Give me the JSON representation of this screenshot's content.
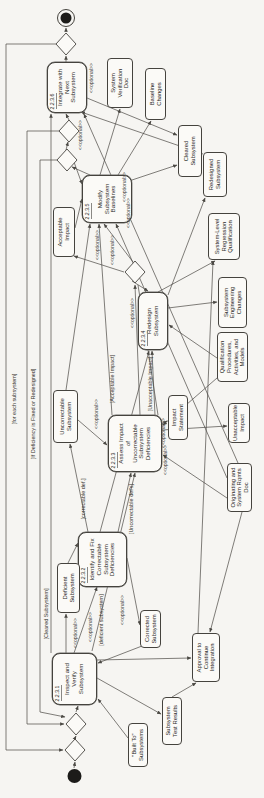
{
  "diagram": {
    "colors": {
      "background": "#f6f5f2",
      "node_fill": "#fbfaf7",
      "stroke": "#45433e",
      "line": "#4a4843",
      "text": "#2b2a27"
    },
    "optional_label": "<<optional>>",
    "activities": [
      {
        "id": "a1",
        "num": "2.2.3.1",
        "label": "Inspect and\nVerify\nSubsystem",
        "x": 93,
        "y": 52,
        "w": 52,
        "h": 45
      },
      {
        "id": "a2",
        "num": "2.2.3.2",
        "label": "Identify and Fix\nCorrectable\nSubsystem\nDeficiencies",
        "x": 211,
        "y": 78,
        "w": 55,
        "h": 49
      },
      {
        "id": "a3",
        "num": "2.2.3.3",
        "label": "Assess Impact\nof\nUncorrectable\nSubsystem\nDeficiencies",
        "x": 326,
        "y": 108,
        "w": 57,
        "h": 54
      },
      {
        "id": "a4",
        "num": "2.2.3.4",
        "label": "Redesign\nSubsystem",
        "x": 448,
        "y": 138,
        "w": 58,
        "h": 30
      },
      {
        "id": "a5",
        "num": "2.2.3.5",
        "label": "Modify\nSubsystem\nBaselines",
        "x": 575,
        "y": 82,
        "w": 48,
        "h": 50
      },
      {
        "id": "a6",
        "num": "2.2.3.6",
        "label": "Integrate with\nNext\nSubsystem",
        "x": 685,
        "y": 47,
        "w": 51,
        "h": 40
      }
    ],
    "objects": [
      {
        "id": "built-to",
        "label": "\"Built To\"\nSubsystems",
        "x": 31,
        "y": 128,
        "w": 44,
        "h": 20
      },
      {
        "id": "test-results",
        "label": "Subsystem\nTest Results",
        "x": 53,
        "y": 162,
        "w": 48,
        "h": 20
      },
      {
        "id": "approval",
        "label": "Approval to\nContinue\nIntegration",
        "x": 116,
        "y": 192,
        "w": 49,
        "h": 28
      },
      {
        "id": "corrected",
        "label": "Corrected\nSubsystem",
        "x": 150,
        "y": 140,
        "w": 38,
        "h": 21
      },
      {
        "id": "deficient",
        "label": "Deficient\nSubsystem",
        "x": 185,
        "y": 57,
        "w": 50,
        "h": 23
      },
      {
        "id": "orig-rqmts-doc",
        "label": "Originating and\nSystem Rqmts\nDoc",
        "x": 286,
        "y": 227,
        "w": 49,
        "h": 25
      },
      {
        "id": "uncorrectable-sub",
        "label": "Uncorrectable\nSubsystem",
        "x": 355,
        "y": 53,
        "w": 53,
        "h": 25
      },
      {
        "id": "impact-statement",
        "label": "Impact\nStatement",
        "x": 358,
        "y": 168,
        "w": 45,
        "h": 20
      },
      {
        "id": "unacceptable",
        "label": "Unacceptable\nImpact",
        "x": 355,
        "y": 228,
        "w": 40,
        "h": 22
      },
      {
        "id": "qual-procedures",
        "label": "Qualification\nProcedures,\nActivities, and\nModels",
        "x": 416,
        "y": 217,
        "w": 50,
        "h": 31
      },
      {
        "id": "subsys-eng-changes",
        "label": "Subsystem\nEngineering\nChanges",
        "x": 470,
        "y": 218,
        "w": 51,
        "h": 29
      },
      {
        "id": "sys-regression",
        "label": "System-Level\nRegression\nQualification",
        "x": 538,
        "y": 208,
        "w": 47,
        "h": 32
      },
      {
        "id": "acceptable",
        "label": "Acceptable\nImpact",
        "x": 541,
        "y": 53,
        "w": 50,
        "h": 22
      },
      {
        "id": "redesigned",
        "label": "Redesigned\nSubsystem",
        "x": 601,
        "y": 203,
        "w": 45,
        "h": 24
      },
      {
        "id": "cleared",
        "label": "Cleared\nSubsystem",
        "x": 621,
        "y": 178,
        "w": 52,
        "h": 24
      },
      {
        "id": "baseline-changes",
        "label": "Baseline\nChanges",
        "x": 678,
        "y": 145,
        "w": 52,
        "h": 21
      },
      {
        "id": "sys-verif-doc",
        "label": "System\nVerification\nDoc",
        "x": 690,
        "y": 107,
        "w": 50,
        "h": 26
      }
    ],
    "diamonds": [
      {
        "id": "merge-start-outer",
        "cx": 48,
        "cy": 75
      },
      {
        "id": "merge-start-inner",
        "cx": 74,
        "cy": 76
      },
      {
        "id": "decision-impact",
        "cx": 526,
        "cy": 135
      },
      {
        "id": "merge-modify-1",
        "cx": 638,
        "cy": 67
      },
      {
        "id": "merge-modify-2",
        "cx": 667,
        "cy": 69
      },
      {
        "id": "decision-final",
        "cx": 754,
        "cy": 66
      }
    ],
    "start": {
      "cx": 22,
      "cy": 74.5,
      "r": 7
    },
    "end": {
      "cx": 780,
      "cy": 66,
      "r": 8.5
    },
    "guards": [
      {
        "label": "[for each subsystem]",
        "x": 399,
        "y": 14
      },
      {
        "label": "[If Deficiency is Fixed or Redesigned]",
        "x": 384,
        "y": 33
      },
      {
        "label": "[Cleared Subsystem]",
        "x": 184,
        "y": 46
      },
      {
        "label": "[deficient subsystem]",
        "x": 178,
        "y": 101
      },
      {
        "label": "[correctable def.]",
        "x": 299,
        "y": 83
      },
      {
        "label": "[Uncorrectable def's]",
        "x": 289,
        "y": 131
      },
      {
        "label": "[Acceptable Impact]",
        "x": 419,
        "y": 112
      },
      {
        "label": "[Unacceptable Impact]",
        "x": 414,
        "y": 150
      }
    ],
    "optionals": [
      {
        "x": 720,
        "y": 91
      },
      {
        "x": 663,
        "y": 80
      },
      {
        "x": 611,
        "y": 124
      },
      {
        "x": 585,
        "y": 128
      },
      {
        "x": 553,
        "y": 97
      },
      {
        "x": 548,
        "y": 112
      },
      {
        "x": 485,
        "y": 132
      },
      {
        "x": 384,
        "y": 96
      },
      {
        "x": 365,
        "y": 163
      },
      {
        "x": 338,
        "y": 165
      },
      {
        "x": 188,
        "y": 122
      },
      {
        "x": 165,
        "y": 75
      },
      {
        "x": 171,
        "y": 90
      }
    ],
    "edges": [
      {
        "x1": 30,
        "y1": 74,
        "x2": 36,
        "y2": 75,
        "a": true
      },
      {
        "x1": 60,
        "y1": 75,
        "x2": 62,
        "y2": 76,
        "a": true
      },
      {
        "x1": 86,
        "y1": 76,
        "x2": 92,
        "y2": 78,
        "a": true
      },
      {
        "x1": 145,
        "y1": 74,
        "x2": 211,
        "y2": 97,
        "a": true
      },
      {
        "x1": 266,
        "y1": 118,
        "x2": 325,
        "y2": 131,
        "a": true
      },
      {
        "x1": 383,
        "y1": 140,
        "x2": 513,
        "y2": 135,
        "a": true
      },
      {
        "x1": 517,
        "y1": 132,
        "x2": 507,
        "y2": 148,
        "a": true
      },
      {
        "x1": 536,
        "y1": 133,
        "x2": 574,
        "y2": 104,
        "a": true
      },
      {
        "x1": 623,
        "y1": 90,
        "x2": 631,
        "y2": 72,
        "a": true
      },
      {
        "x1": 648,
        "y1": 66,
        "x2": 656,
        "y2": 68,
        "a": true
      },
      {
        "x1": 678,
        "y1": 69,
        "x2": 684,
        "y2": 66,
        "a": true
      },
      {
        "x1": 736,
        "y1": 66,
        "x2": 742,
        "y2": 66,
        "a": true
      },
      {
        "x1": 766,
        "y1": 66,
        "x2": 770,
        "y2": 66,
        "a": true
      },
      {
        "x1": 754,
        "y1": 56,
        "x2": 754,
        "y2": 6,
        "a": false
      },
      {
        "x1": 754,
        "y1": 6,
        "x2": 48,
        "y2": 6,
        "a": false
      },
      {
        "x1": 48,
        "y1": 6,
        "x2": 48,
        "y2": 63,
        "a": true
      },
      {
        "x1": 667,
        "y1": 59,
        "x2": 667,
        "y2": 27,
        "a": false
      },
      {
        "x1": 667,
        "y1": 27,
        "x2": 74,
        "y2": 27,
        "a": false
      },
      {
        "x1": 74,
        "y1": 27,
        "x2": 74,
        "y2": 64,
        "a": true
      },
      {
        "x1": 638,
        "y1": 57,
        "x2": 638,
        "y2": 40,
        "a": false
      },
      {
        "x1": 638,
        "y1": 40,
        "x2": 86,
        "y2": 40,
        "a": false
      },
      {
        "x1": 86,
        "y1": 40,
        "x2": 81,
        "y2": 65,
        "a": true
      },
      {
        "x1": 145,
        "y1": 51,
        "x2": 684,
        "y2": 51,
        "a": true
      },
      {
        "x1": 120,
        "y1": 97,
        "x2": 84,
        "y2": 161,
        "a": true
      },
      {
        "x1": 60,
        "y1": 128,
        "x2": 99,
        "y2": 98,
        "a": true
      },
      {
        "x1": 138,
        "y1": 97,
        "x2": 140,
        "y2": 191,
        "a": true
      },
      {
        "x1": 286,
        "y1": 242,
        "x2": 166,
        "y2": 210,
        "a": true
      },
      {
        "x1": 165,
        "y1": 198,
        "x2": 537,
        "y2": 213,
        "a": true
      },
      {
        "x1": 101,
        "y1": 172,
        "x2": 115,
        "y2": 196,
        "a": true
      },
      {
        "x1": 240,
        "y1": 127,
        "x2": 173,
        "y2": 140,
        "a": true
      },
      {
        "x1": 152,
        "y1": 142,
        "x2": 135,
        "y2": 98,
        "a": true
      },
      {
        "x1": 145,
        "y1": 66,
        "x2": 184,
        "y2": 66,
        "a": true
      },
      {
        "x1": 235,
        "y1": 68,
        "x2": 255,
        "y2": 78,
        "a": true
      },
      {
        "x1": 266,
        "y1": 88,
        "x2": 354,
        "y2": 70,
        "a": true
      },
      {
        "x1": 378,
        "y1": 78,
        "x2": 353,
        "y2": 107,
        "a": true
      },
      {
        "x1": 383,
        "y1": 155,
        "x2": 447,
        "y2": 152,
        "a": true
      },
      {
        "x1": 383,
        "y1": 112,
        "x2": 574,
        "y2": 99,
        "a": true
      },
      {
        "x1": 383,
        "y1": 158,
        "x2": 513,
        "y2": 138,
        "a": false
      },
      {
        "x1": 526,
        "y1": 124,
        "x2": 542,
        "y2": 74,
        "a": true
      },
      {
        "x1": 570,
        "y1": 75,
        "x2": 599,
        "y2": 82,
        "a": true
      },
      {
        "x1": 636,
        "y1": 74,
        "x2": 614,
        "y2": 82,
        "a": true
      },
      {
        "x1": 490,
        "y1": 168,
        "x2": 496,
        "y2": 217,
        "a": true
      },
      {
        "x1": 506,
        "y1": 158,
        "x2": 537,
        "y2": 215,
        "a": true
      },
      {
        "x1": 503,
        "y1": 168,
        "x2": 600,
        "y2": 205,
        "a": true
      },
      {
        "x1": 440,
        "y1": 217,
        "x2": 473,
        "y2": 169,
        "a": true
      },
      {
        "x1": 420,
        "y1": 217,
        "x2": 373,
        "y2": 163,
        "a": true
      },
      {
        "x1": 300,
        "y1": 227,
        "x2": 343,
        "y2": 163,
        "a": true
      },
      {
        "x1": 320,
        "y1": 227,
        "x2": 574,
        "y2": 116,
        "a": true
      },
      {
        "x1": 335,
        "y1": 238,
        "x2": 684,
        "y2": 84,
        "a": true
      },
      {
        "x1": 374,
        "y1": 162,
        "x2": 377,
        "y2": 167,
        "a": true
      },
      {
        "x1": 368,
        "y1": 162,
        "x2": 372,
        "y2": 227,
        "a": true
      },
      {
        "x1": 623,
        "y1": 118,
        "x2": 677,
        "y2": 151,
        "a": true
      },
      {
        "x1": 623,
        "y1": 100,
        "x2": 689,
        "y2": 120,
        "a": true
      },
      {
        "x1": 618,
        "y1": 132,
        "x2": 633,
        "y2": 177,
        "a": true
      },
      {
        "x1": 700,
        "y1": 87,
        "x2": 663,
        "y2": 177,
        "a": true
      },
      {
        "x1": 644,
        "y1": 203,
        "x2": 686,
        "y2": 81,
        "a": true
      },
      {
        "x1": 408,
        "y1": 66,
        "x2": 574,
        "y2": 90,
        "a": true
      },
      {
        "x1": 147,
        "y1": 92,
        "x2": 325,
        "y2": 135,
        "a": true
      },
      {
        "x1": 266,
        "y1": 100,
        "x2": 447,
        "y2": 149,
        "a": true
      }
    ]
  }
}
